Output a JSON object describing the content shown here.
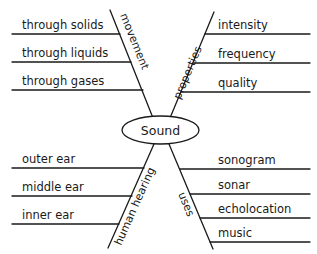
{
  "center": {
    "label": "Sound"
  },
  "branches": [
    {
      "id": "movement",
      "label": "movement",
      "items": [
        "through solids",
        "through liquids",
        "through gases"
      ]
    },
    {
      "id": "properties",
      "label": "properties",
      "items": [
        "intensity",
        "frequency",
        "quality"
      ]
    },
    {
      "id": "human-hearing",
      "label": "human hearing",
      "items": [
        "outer ear",
        "middle ear",
        "inner ear"
      ]
    },
    {
      "id": "uses",
      "label": "uses",
      "items": [
        "sonogram",
        "sonar",
        "echolocation",
        "music"
      ]
    }
  ]
}
